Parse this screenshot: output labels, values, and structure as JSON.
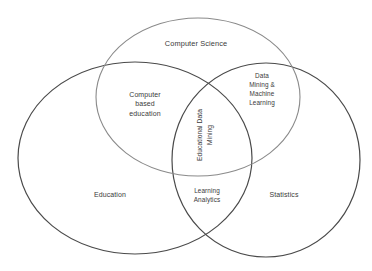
{
  "diagram": {
    "type": "venn",
    "sets": [
      {
        "id": "computer_science",
        "label": "Computer Science",
        "cx": 198,
        "cy": 97,
        "rx": 102,
        "ry": 79,
        "stroke": "#8a8a8a",
        "stroke_width": 1.1
      },
      {
        "id": "education",
        "label": "Education",
        "cx": 135,
        "cy": 158,
        "rx": 117,
        "ry": 96,
        "stroke": "#4a4a4a",
        "stroke_width": 1.2
      },
      {
        "id": "statistics",
        "label": "Statistics",
        "cx": 266,
        "cy": 160,
        "rx": 94,
        "ry": 97,
        "stroke": "#4a4a4a",
        "stroke_width": 1.2
      }
    ],
    "labels": {
      "computer_science": {
        "lines": [
          "Computer Science"
        ]
      },
      "education": {
        "lines": [
          "Education"
        ]
      },
      "statistics": {
        "lines": [
          "Statistics"
        ]
      },
      "computer_based_education": {
        "lines": [
          "Computer",
          "based",
          "education"
        ]
      },
      "data_mining_ml": {
        "lines": [
          "Data",
          "Mining &",
          "Machine",
          "Learning"
        ]
      },
      "learning_analytics": {
        "lines": [
          "Learning",
          "Analytics"
        ]
      },
      "educational_data_mining": {
        "lines": [
          "Educational Data",
          "Mining"
        ],
        "rotation": -90
      }
    },
    "intersections": [
      {
        "sets": [
          "computer_science",
          "education"
        ],
        "label": "Computer based education"
      },
      {
        "sets": [
          "computer_science",
          "statistics"
        ],
        "label": "Data Mining & Machine Learning"
      },
      {
        "sets": [
          "education",
          "statistics"
        ],
        "label": "Learning Analytics"
      },
      {
        "sets": [
          "computer_science",
          "education",
          "statistics"
        ],
        "label": "Educational Data Mining"
      }
    ],
    "colors": {
      "background": "#ffffff",
      "text": "#3a3a3a",
      "stroke_dark": "#4a4a4a",
      "stroke_light": "#8a8a8a"
    }
  }
}
